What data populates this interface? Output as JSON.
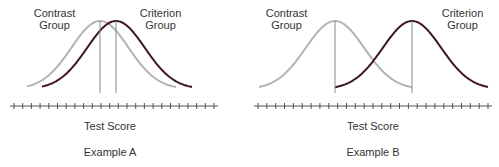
{
  "colors": {
    "contrast_curve": "#b3b3b3",
    "criterion_curve": "#3d1620",
    "axis": "#555555",
    "peak_line": "#8a8a8a",
    "text": "#333333"
  },
  "panels": [
    {
      "id": "A",
      "contrast_label": [
        "Contrast",
        "Group"
      ],
      "criterion_label": [
        "Criterion",
        "Group"
      ],
      "axis_label": "Test Score",
      "title": "Example A",
      "curves": {
        "contrast": {
          "start_x": 27,
          "peak_x": 100,
          "end_x": 176
        },
        "criterion": {
          "start_x": 42,
          "peak_x": 116,
          "end_x": 192
        }
      },
      "axis": {
        "x1": 10,
        "x2": 218,
        "y": 106,
        "ticks": 24
      }
    },
    {
      "id": "B",
      "contrast_label": [
        "Contrast",
        "Group"
      ],
      "criterion_label": [
        "Criterion",
        "Group"
      ],
      "axis_label": "Test Score",
      "title": "Example B",
      "curves": {
        "contrast": {
          "start_x": 259,
          "peak_x": 335,
          "end_x": 412,
          "truncated_at": 412
        },
        "criterion": {
          "start_x": 335,
          "peak_x": 412,
          "end_x": 488,
          "truncated_from": 335
        }
      },
      "axis": {
        "x1": 254,
        "x2": 492,
        "y": 106,
        "ticks": 27
      }
    }
  ]
}
